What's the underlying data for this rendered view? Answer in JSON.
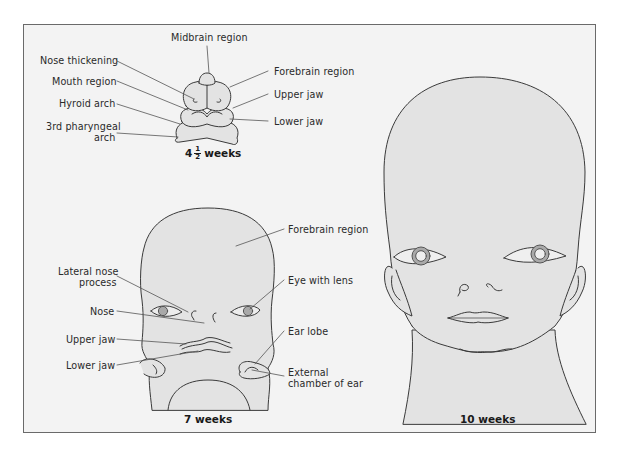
{
  "figure": {
    "colors": {
      "background": "#ffffff",
      "panel": "#f3f3f3",
      "skin": "#e3e3e3",
      "outline": "#3a3a3a",
      "iris": "#a9a9a9",
      "frame": "#6a6a6a"
    }
  },
  "stages": [
    {
      "id": "4.5-weeks",
      "caption_whole": "4",
      "caption_frac_num": "1",
      "caption_frac_den": "2",
      "caption_unit": "weeks",
      "labels": [
        {
          "text": "Midbrain region",
          "side": "top"
        },
        {
          "text": "Nose thickening",
          "side": "left"
        },
        {
          "text": "Mouth region",
          "side": "left"
        },
        {
          "text": "Hyroid arch",
          "side": "left"
        },
        {
          "text": "3rd pharyngeal",
          "side": "left"
        },
        {
          "text": "arch",
          "side": "left"
        },
        {
          "text": "Forebrain region",
          "side": "right"
        },
        {
          "text": "Upper jaw",
          "side": "right"
        },
        {
          "text": "Lower jaw",
          "side": "right"
        }
      ]
    },
    {
      "id": "7-weeks",
      "caption": "7 weeks",
      "labels": [
        {
          "text": "Lateral nose",
          "side": "left"
        },
        {
          "text": "process",
          "side": "left"
        },
        {
          "text": "Nose",
          "side": "left"
        },
        {
          "text": "Upper jaw",
          "side": "left"
        },
        {
          "text": "Lower jaw",
          "side": "left"
        },
        {
          "text": "Forebrain region",
          "side": "right"
        },
        {
          "text": "Eye with lens",
          "side": "right"
        },
        {
          "text": "Ear lobe",
          "side": "right"
        },
        {
          "text": "External",
          "side": "right"
        },
        {
          "text": "chamber of ear",
          "side": "right"
        }
      ]
    },
    {
      "id": "10-weeks",
      "caption": "10 weeks",
      "labels": []
    }
  ]
}
